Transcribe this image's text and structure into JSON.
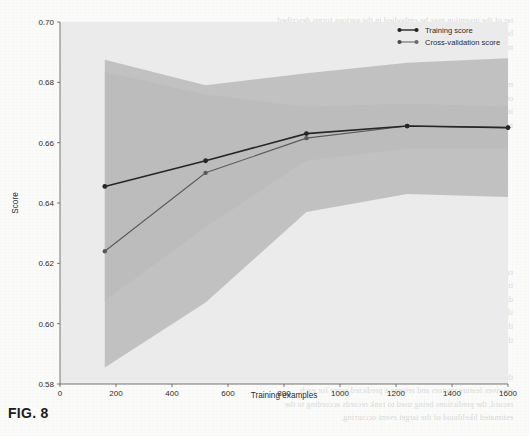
{
  "figure": {
    "caption": "FIG. 8",
    "axes": {
      "xlabel": "Training examples",
      "ylabel": "Score",
      "x_ticks": [
        "0",
        "200",
        "400",
        "600",
        "800",
        "1000",
        "1200",
        "1400",
        "1600"
      ],
      "y_ticks": [
        "0.58",
        "0.60",
        "0.62",
        "0.64",
        "0.66",
        "0.68",
        "0.70"
      ]
    },
    "legend": {
      "items": [
        {
          "label": "Training score",
          "color": "#262626",
          "marker": "circle-marker"
        },
        {
          "label": "Cross-validation score",
          "color": "#5a5a5a",
          "marker": "circle-marker"
        }
      ]
    },
    "plot_background": "#ebebeb",
    "band_colors": {
      "training": "#d4d4d4",
      "cross_validation": "#b9b9b9"
    }
  },
  "chart_data": {
    "type": "line",
    "title": "",
    "xlabel": "Training examples",
    "ylabel": "Score",
    "xlim": [
      0,
      1600
    ],
    "ylim": [
      0.58,
      0.7
    ],
    "x_ticks": [
      0,
      200,
      400,
      600,
      800,
      1000,
      1200,
      1400,
      1600
    ],
    "y_ticks": [
      0.58,
      0.6,
      0.62,
      0.64,
      0.66,
      0.68,
      0.7
    ],
    "grid": false,
    "legend_position": "upper right",
    "x": [
      160,
      520,
      880,
      1240,
      1600
    ],
    "series": [
      {
        "name": "Training score",
        "color": "#262626",
        "values": [
          0.6455,
          0.654,
          0.663,
          0.6655,
          0.665
        ],
        "band_upper": [
          0.6835,
          0.676,
          0.672,
          0.673,
          0.672
        ],
        "band_lower": [
          0.6075,
          0.632,
          0.654,
          0.658,
          0.658
        ]
      },
      {
        "name": "Cross-validation score",
        "color": "#5a5a5a",
        "values": [
          0.624,
          0.65,
          0.6615,
          0.6655,
          0.665
        ],
        "band_upper": [
          0.6875,
          0.679,
          0.683,
          0.6865,
          0.688
        ],
        "band_lower": [
          0.5855,
          0.607,
          0.637,
          0.643,
          0.642
        ]
      }
    ]
  }
}
